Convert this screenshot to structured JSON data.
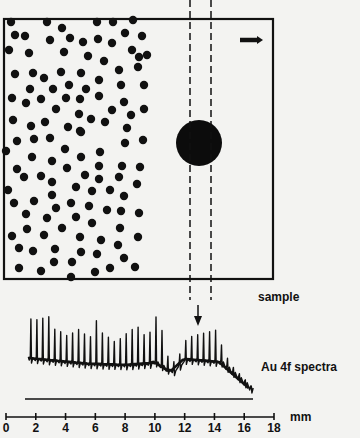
{
  "figure": {
    "labels": {
      "sample": "sample",
      "spectra": "Au 4f spectra",
      "unit": "mm"
    },
    "axis": {
      "min": 0,
      "max": 18,
      "step": 2,
      "ticks": [
        "0",
        "2",
        "4",
        "6",
        "8",
        "10",
        "12",
        "14",
        "16",
        "18"
      ]
    },
    "colors": {
      "ink": "#111111",
      "background": "#f3f3f1"
    },
    "sample_rect": {
      "x": 4,
      "y": 19,
      "w": 269,
      "h": 260
    },
    "big_particle": {
      "cx": 199,
      "cy": 143,
      "r": 23
    },
    "probe_beam": {
      "x_left": 190,
      "x_right": 211,
      "y_top": 0,
      "y_bottom": 300
    },
    "scan_direction_arrow": {
      "x1": 240,
      "x2": 262,
      "y": 40
    },
    "small_dots": [
      [
        11,
        22
      ],
      [
        47,
        22
      ],
      [
        62,
        28
      ],
      [
        97,
        22
      ],
      [
        113,
        22
      ],
      [
        133,
        20
      ],
      [
        15,
        35
      ],
      [
        25,
        36
      ],
      [
        50,
        40
      ],
      [
        70,
        38
      ],
      [
        83,
        42
      ],
      [
        98,
        39
      ],
      [
        112,
        43
      ],
      [
        125,
        33
      ],
      [
        142,
        36
      ],
      [
        9,
        50
      ],
      [
        29,
        53
      ],
      [
        64,
        52
      ],
      [
        88,
        56
      ],
      [
        104,
        61
      ],
      [
        132,
        50
      ],
      [
        139,
        57
      ],
      [
        147,
        55
      ],
      [
        15,
        74
      ],
      [
        33,
        73
      ],
      [
        44,
        78
      ],
      [
        61,
        72
      ],
      [
        81,
        73
      ],
      [
        119,
        70
      ],
      [
        138,
        67
      ],
      [
        30,
        89
      ],
      [
        53,
        89
      ],
      [
        69,
        85
      ],
      [
        86,
        89
      ],
      [
        99,
        80
      ],
      [
        121,
        85
      ],
      [
        144,
        85
      ],
      [
        12,
        98
      ],
      [
        26,
        103
      ],
      [
        41,
        99
      ],
      [
        66,
        98
      ],
      [
        80,
        99
      ],
      [
        99,
        96
      ],
      [
        124,
        102
      ],
      [
        56,
        109
      ],
      [
        79,
        114
      ],
      [
        112,
        110
      ],
      [
        131,
        115
      ],
      [
        144,
        109
      ],
      [
        13,
        120
      ],
      [
        31,
        126
      ],
      [
        45,
        122
      ],
      [
        68,
        127
      ],
      [
        80,
        131
      ],
      [
        91,
        119
      ],
      [
        105,
        122
      ],
      [
        127,
        128
      ],
      [
        17,
        141
      ],
      [
        34,
        139
      ],
      [
        50,
        138
      ],
      [
        81,
        132
      ],
      [
        143,
        140
      ],
      [
        125,
        143
      ],
      [
        6,
        151
      ],
      [
        32,
        157
      ],
      [
        52,
        161
      ],
      [
        65,
        149
      ],
      [
        81,
        157
      ],
      [
        100,
        152
      ],
      [
        17,
        169
      ],
      [
        24,
        177
      ],
      [
        41,
        176
      ],
      [
        52,
        182
      ],
      [
        67,
        168
      ],
      [
        85,
        175
      ],
      [
        99,
        166
      ],
      [
        99,
        179
      ],
      [
        122,
        166
      ],
      [
        140,
        167
      ],
      [
        119,
        177
      ],
      [
        137,
        184
      ],
      [
        8,
        190
      ],
      [
        76,
        187
      ],
      [
        92,
        191
      ],
      [
        110,
        190
      ],
      [
        124,
        196
      ],
      [
        52,
        195
      ],
      [
        14,
        203
      ],
      [
        34,
        201
      ],
      [
        56,
        208
      ],
      [
        71,
        203
      ],
      [
        89,
        206
      ],
      [
        107,
        210
      ],
      [
        121,
        211
      ],
      [
        139,
        213
      ],
      [
        26,
        214
      ],
      [
        47,
        218
      ],
      [
        76,
        217
      ],
      [
        92,
        223
      ],
      [
        120,
        228
      ],
      [
        62,
        228
      ],
      [
        80,
        237
      ],
      [
        101,
        240
      ],
      [
        138,
        237
      ],
      [
        12,
        236
      ],
      [
        27,
        229
      ],
      [
        44,
        235
      ],
      [
        19,
        248
      ],
      [
        33,
        251
      ],
      [
        55,
        249
      ],
      [
        81,
        252
      ],
      [
        97,
        254
      ],
      [
        118,
        245
      ],
      [
        124,
        258
      ],
      [
        19,
        268
      ],
      [
        41,
        271
      ],
      [
        54,
        262
      ],
      [
        72,
        262
      ],
      [
        95,
        272
      ],
      [
        110,
        268
      ],
      [
        135,
        267
      ],
      [
        71,
        277
      ]
    ],
    "spectra": {
      "baseline_y": 399,
      "x_start_mm": 1.5,
      "x_end_mm": 16.3,
      "peak_heights_px": [
        38,
        38,
        40,
        42,
        30,
        28,
        25,
        28,
        32,
        28,
        26,
        42,
        30,
        26,
        22,
        25,
        30,
        34,
        36,
        28,
        30,
        44,
        34,
        12,
        8,
        10,
        18,
        22,
        24,
        26,
        28,
        30,
        16,
        8,
        4,
        3,
        2,
        1
      ]
    }
  }
}
